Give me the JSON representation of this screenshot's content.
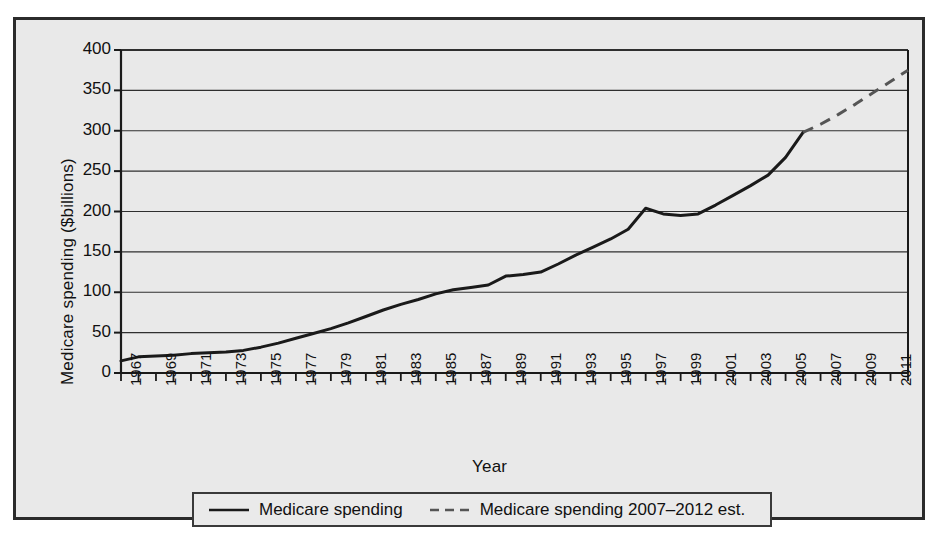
{
  "chart_data": {
    "type": "line",
    "title": "",
    "xlabel": "Year",
    "ylabel": "Medicare spending ($billions)",
    "xlim": [
      1967,
      2012
    ],
    "ylim": [
      0,
      400
    ],
    "yticks": [
      0,
      50,
      100,
      150,
      200,
      250,
      300,
      350,
      400
    ],
    "ytick_labels": [
      "0",
      "50",
      "100",
      "150",
      "200",
      "250",
      "300",
      "350",
      "400"
    ],
    "xticks": [
      1967,
      1968,
      1969,
      1970,
      1971,
      1972,
      1973,
      1974,
      1975,
      1976,
      1977,
      1978,
      1979,
      1980,
      1981,
      1982,
      1983,
      1984,
      1985,
      1986,
      1987,
      1988,
      1989,
      1990,
      1991,
      1992,
      1993,
      1994,
      1995,
      1996,
      1997,
      1998,
      1999,
      2000,
      2001,
      2002,
      2003,
      2004,
      2005,
      2006,
      2007,
      2008,
      2009,
      2010,
      2011,
      2012
    ],
    "xtick_labels": [
      "1967",
      "1969",
      "1971",
      "1973",
      "1975",
      "1977",
      "1979",
      "1981",
      "1983",
      "1985",
      "1987",
      "1989",
      "1991",
      "1993",
      "1995",
      "1997",
      "1999",
      "2001",
      "2003",
      "2005",
      "2007",
      "2009",
      "2011"
    ],
    "xtick_label_years": [
      1967,
      1969,
      1971,
      1973,
      1975,
      1977,
      1979,
      1981,
      1983,
      1985,
      1987,
      1989,
      1991,
      1993,
      1995,
      1997,
      1999,
      2001,
      2003,
      2005,
      2007,
      2009,
      2011
    ],
    "grid": "horizontal",
    "legend_position": "bottom-outside",
    "series": [
      {
        "name": "Medicare spending",
        "style": "solid",
        "color": "#1a1a1a",
        "x": [
          1967,
          1968,
          1969,
          1970,
          1971,
          1972,
          1973,
          1974,
          1975,
          1976,
          1977,
          1978,
          1979,
          1980,
          1981,
          1982,
          1983,
          1984,
          1985,
          1986,
          1987,
          1988,
          1989,
          1990,
          1991,
          1992,
          1993,
          1994,
          1995,
          1996,
          1997,
          1998,
          1999,
          2000,
          2001,
          2002,
          2003,
          2004,
          2005,
          2006
        ],
        "values": [
          15,
          20,
          21,
          22,
          24,
          25,
          26,
          28,
          32,
          37,
          43,
          49,
          55,
          62,
          70,
          78,
          85,
          91,
          98,
          103,
          106,
          109,
          120,
          122,
          125,
          135,
          146,
          156,
          166,
          178,
          204,
          197,
          195,
          197,
          208,
          220,
          232,
          245,
          267,
          298
        ]
      },
      {
        "name": "Medicare spending 2007–2012 est.",
        "style": "dashed",
        "color": "#555555",
        "x": [
          2006,
          2007,
          2008,
          2009,
          2010,
          2011,
          2012
        ],
        "values": [
          298,
          308,
          320,
          333,
          347,
          361,
          375
        ]
      }
    ]
  },
  "legend": {
    "entries": [
      {
        "label": "Medicare spending",
        "style": "solid"
      },
      {
        "label": "Medicare spending 2007–2012 est.",
        "style": "dashed"
      }
    ]
  },
  "axes": {
    "y_title": "Medicare spending ($billions)",
    "x_title": "Year"
  }
}
